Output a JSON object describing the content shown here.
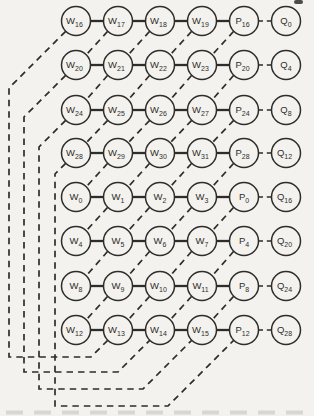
{
  "colors": {
    "paper": "#f3f2ee",
    "ink": "#2f2d29",
    "artifact": "#c3c1ba"
  },
  "diagram": {
    "description_of_node_types": [
      "W weight cells",
      "P partial-product cells",
      "Q output cells"
    ],
    "rows": [
      {
        "nodes": [
          {
            "base": "W",
            "sub": "16"
          },
          {
            "base": "W",
            "sub": "17"
          },
          {
            "base": "W",
            "sub": "18"
          },
          {
            "base": "W",
            "sub": "19"
          },
          {
            "base": "P",
            "sub": "16"
          },
          {
            "base": "Q",
            "sub": "0"
          }
        ]
      },
      {
        "nodes": [
          {
            "base": "W",
            "sub": "20"
          },
          {
            "base": "W",
            "sub": "21"
          },
          {
            "base": "W",
            "sub": "22"
          },
          {
            "base": "W",
            "sub": "23"
          },
          {
            "base": "P",
            "sub": "20"
          },
          {
            "base": "Q",
            "sub": "4"
          }
        ]
      },
      {
        "nodes": [
          {
            "base": "W",
            "sub": "24"
          },
          {
            "base": "W",
            "sub": "25"
          },
          {
            "base": "W",
            "sub": "26"
          },
          {
            "base": "W",
            "sub": "27"
          },
          {
            "base": "P",
            "sub": "24"
          },
          {
            "base": "Q",
            "sub": "8"
          }
        ]
      },
      {
        "nodes": [
          {
            "base": "W",
            "sub": "28"
          },
          {
            "base": "W",
            "sub": "29"
          },
          {
            "base": "W",
            "sub": "30"
          },
          {
            "base": "W",
            "sub": "31"
          },
          {
            "base": "P",
            "sub": "28"
          },
          {
            "base": "Q",
            "sub": "12"
          }
        ]
      },
      {
        "nodes": [
          {
            "base": "W",
            "sub": "0"
          },
          {
            "base": "W",
            "sub": "1"
          },
          {
            "base": "W",
            "sub": "2"
          },
          {
            "base": "W",
            "sub": "3"
          },
          {
            "base": "P",
            "sub": "0"
          },
          {
            "base": "Q",
            "sub": "16"
          }
        ]
      },
      {
        "nodes": [
          {
            "base": "W",
            "sub": "4"
          },
          {
            "base": "W",
            "sub": "5"
          },
          {
            "base": "W",
            "sub": "6"
          },
          {
            "base": "W",
            "sub": "7"
          },
          {
            "base": "P",
            "sub": "4"
          },
          {
            "base": "Q",
            "sub": "20"
          }
        ]
      },
      {
        "nodes": [
          {
            "base": "W",
            "sub": "8"
          },
          {
            "base": "W",
            "sub": "9"
          },
          {
            "base": "W",
            "sub": "10"
          },
          {
            "base": "W",
            "sub": "11"
          },
          {
            "base": "P",
            "sub": "8"
          },
          {
            "base": "Q",
            "sub": "24"
          }
        ]
      },
      {
        "nodes": [
          {
            "base": "W",
            "sub": "12"
          },
          {
            "base": "W",
            "sub": "13"
          },
          {
            "base": "W",
            "sub": "14"
          },
          {
            "base": "W",
            "sub": "15"
          },
          {
            "base": "P",
            "sub": "12"
          },
          {
            "base": "Q",
            "sub": "28"
          }
        ]
      }
    ],
    "edge_rules": {
      "solid_horizontal": "between columns 1-5 of every row",
      "dashed_horizontal": "between P and Q of every row",
      "dashed_diagonals": "from each node in columns 2-5 down-left to the node one row below, one column left",
      "wraparound_dashed_paths": [
        {
          "from": "W16",
          "to": "W13"
        },
        {
          "from": "W20",
          "to": "W14"
        },
        {
          "from": "W24",
          "to": "W15"
        },
        {
          "from": "W28",
          "to": "P12"
        }
      ]
    }
  }
}
